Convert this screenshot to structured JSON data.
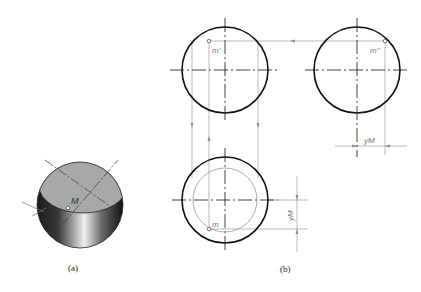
{
  "figure": {
    "panel_a": {
      "caption": "(a)",
      "point_label": "M"
    },
    "panel_b": {
      "caption": "(b)",
      "front_view": {
        "point_label": "m'"
      },
      "side_view": {
        "point_label": "m''",
        "dimension_label": "yM"
      },
      "top_view": {
        "point_label": "m",
        "dimension_label": "yM"
      }
    }
  },
  "colors": {
    "outline": "#111111",
    "thin_line": "#888888",
    "cut_face": "#a8a8a8",
    "sphere_dark": "#1a1a1a",
    "sphere_light": "#e8e8e8"
  }
}
